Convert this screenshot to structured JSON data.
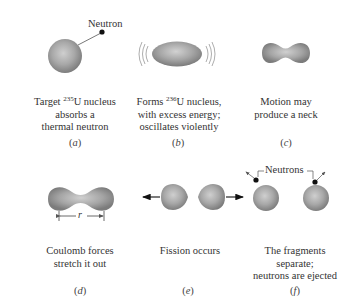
{
  "colors": {
    "nucleus_light": "#c9c9c9",
    "nucleus_mid": "#a3a3a3",
    "nucleus_dark": "#7d7d7d",
    "neutron": "#111111",
    "line": "#444444",
    "text": "#333333"
  },
  "panels": [
    {
      "id": "a",
      "label": "a",
      "caption_pre": "Target ",
      "caption_sup": "235",
      "caption_post": "U nucleus",
      "caption_line2": "absorbs a",
      "caption_line3": "thermal neutron",
      "callout": "Neutron"
    },
    {
      "id": "b",
      "label": "b",
      "caption_pre": "Forms ",
      "caption_sup": "236",
      "caption_post": "U nucleus,",
      "caption_line2": "with excess energy;",
      "caption_line3": "oscillates violently"
    },
    {
      "id": "c",
      "label": "c",
      "caption_line1": "Motion may",
      "caption_line2": "produce a neck"
    },
    {
      "id": "d",
      "label": "d",
      "caption_line1": "Coulomb forces",
      "caption_line2": "stretch it out",
      "dimension_label": "r"
    },
    {
      "id": "e",
      "label": "e",
      "caption_line1": "Fission occurs"
    },
    {
      "id": "f",
      "label": "f",
      "caption_line1": "The fragments",
      "caption_line2": "separate;",
      "caption_line3": "neutrons are ejected",
      "callout": "Neutrons"
    }
  ]
}
